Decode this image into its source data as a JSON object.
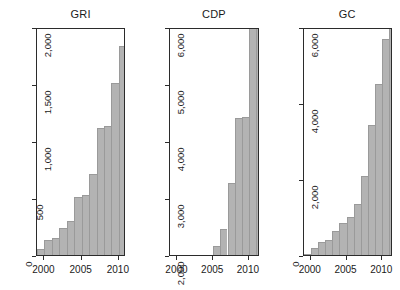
{
  "figure": {
    "background": "#ffffff",
    "bar_fill": "#b3b3b3",
    "bar_edge": "#9a9a9a",
    "axis_color": "#2b2b2b"
  },
  "chart_data": [
    {
      "type": "bar",
      "title": "GRI",
      "xlabel": "",
      "ylabel": "",
      "grid": false,
      "legend": false,
      "xlim": [
        1999,
        2011
      ],
      "ylim": [
        0,
        2000
      ],
      "xticks": [
        2000,
        2005,
        2010
      ],
      "xticklabels": [
        "2000",
        "2005",
        "2010"
      ],
      "yticks": [
        0,
        500,
        1000,
        1500,
        2000
      ],
      "yticklabels": [
        "0",
        "500",
        "1,000",
        "1,500",
        "2,000"
      ],
      "categories": [
        1999,
        2000,
        2001,
        2002,
        2003,
        2004,
        2005,
        2006,
        2007,
        2008,
        2009,
        2010
      ],
      "values": [
        50,
        130,
        145,
        235,
        295,
        510,
        525,
        710,
        1115,
        1135,
        1505,
        1830
      ]
    },
    {
      "type": "bar",
      "title": "CDP",
      "xlabel": "",
      "ylabel": "",
      "grid": false,
      "legend": false,
      "xlim": [
        1999,
        2011.5
      ],
      "ylim": [
        2000,
        6000
      ],
      "xticks": [
        2000,
        2005,
        2010
      ],
      "xticklabels": [
        "2000",
        "2005",
        "2010"
      ],
      "yticks": [
        2000,
        3000,
        4000,
        5000,
        6000
      ],
      "yticklabels": [
        "2,000",
        "3,000",
        "4,000",
        "5,000",
        "6,000"
      ],
      "categories": [
        2005,
        2006,
        2007,
        2008,
        2009,
        2010,
        2011
      ],
      "values": [
        2150,
        2450,
        3260,
        4400,
        4420,
        6200,
        6150
      ]
    },
    {
      "type": "bar",
      "title": "GC",
      "xlabel": "",
      "ylabel": "",
      "grid": false,
      "legend": false,
      "xlim": [
        1999,
        2011.5
      ],
      "ylim": [
        0,
        6000
      ],
      "xticks": [
        2000,
        2005,
        2010
      ],
      "xticklabels": [
        "2000",
        "2005",
        "2010"
      ],
      "yticks": [
        0,
        2000,
        4000,
        6000
      ],
      "yticklabels": [
        "0",
        "2,000",
        "4,000",
        "6,000"
      ],
      "categories": [
        1999,
        2000,
        2001,
        2002,
        2003,
        2004,
        2005,
        2006,
        2007,
        2008,
        2009,
        2010,
        2011
      ],
      "values": [
        30,
        180,
        330,
        390,
        640,
        850,
        1010,
        1330,
        2090,
        3420,
        4510,
        5680,
        6100
      ]
    }
  ]
}
